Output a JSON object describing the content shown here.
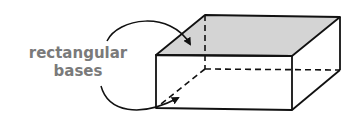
{
  "diagram": {
    "label": {
      "line1": "rectangular",
      "line2": "bases"
    },
    "colors": {
      "base_fill": "#d4d4d4",
      "edge": "#111111",
      "label": "#7a7a7a"
    },
    "prism": {
      "front_top_left": [
        156,
        55
      ],
      "front_top_right": [
        292,
        56
      ],
      "front_bottom_left": [
        156,
        108
      ],
      "front_bottom_right": [
        292,
        110
      ],
      "back_top_left": [
        205,
        15
      ],
      "back_top_right": [
        340,
        17
      ],
      "back_bottom_left": [
        205,
        69
      ],
      "back_bottom_right": [
        340,
        70
      ]
    },
    "arrows": [
      {
        "target": "top-base",
        "description": "curved arrow from label to top face"
      },
      {
        "target": "bottom-base",
        "description": "curved arrow from label to bottom face"
      }
    ]
  }
}
